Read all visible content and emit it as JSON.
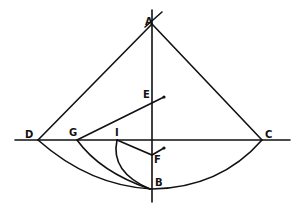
{
  "diagram": {
    "type": "geometric-construction",
    "labels": {
      "A": "A",
      "B": "B",
      "C": "C",
      "D": "D",
      "E": "E",
      "F": "F",
      "G": "G",
      "I": "I"
    },
    "points": {
      "A": [
        152,
        22
      ],
      "B": [
        152,
        188
      ],
      "C": [
        262,
        140
      ],
      "D": [
        38,
        140
      ],
      "E": [
        152,
        103
      ],
      "F": [
        152,
        156
      ],
      "G": [
        77,
        140
      ],
      "I": [
        117,
        140
      ]
    },
    "stroke_color": "#111111",
    "background": "#ffffff"
  }
}
